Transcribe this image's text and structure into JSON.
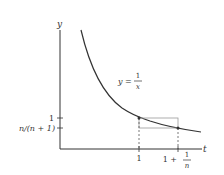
{
  "figure": {
    "axes": {
      "x_label": "t",
      "y_label": "y"
    },
    "curve_label": {
      "lhs": "y =",
      "numerator": "1",
      "denominator": "x"
    },
    "y_ticks": [
      {
        "label": "1"
      },
      {
        "label": "n/(n + 1)"
      }
    ],
    "x_ticks": [
      {
        "label": "1"
      },
      {
        "label_main": "1 +",
        "numerator": "1",
        "denominator": "n"
      }
    ],
    "colors": {
      "axis": "#333333",
      "curve": "#333333",
      "box": "#999999",
      "dashed": "#555555"
    }
  }
}
